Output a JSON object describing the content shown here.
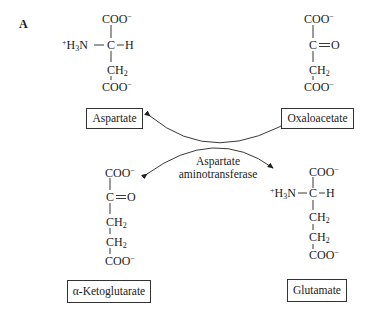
{
  "panel_label": "A",
  "enzyme": {
    "line1": "Aspartate",
    "line2": "aminotransferase"
  },
  "compounds": {
    "aspartate": {
      "name": "Aspartate",
      "top": "COO",
      "charge": "−",
      "amino_left": "H",
      "amino_sub": "3",
      "amino_n": "N",
      "amino_plus": "+",
      "alpha_c": "C",
      "alpha_h": "H",
      "ch2_c": "CH",
      "ch2_sub": "2",
      "bottom": "COO"
    },
    "oxaloacetate": {
      "name": "Oxaloacetate",
      "top": "COO",
      "charge": "−",
      "keto_c": "C",
      "keto_o": "O",
      "ch2_c": "CH",
      "ch2_sub": "2",
      "bottom": "COO"
    },
    "alpha_ketoglutarate": {
      "name": "α-Ketoglutarate",
      "top": "COO",
      "charge": "−",
      "keto_c": "C",
      "keto_o": "O",
      "ch2_c": "CH",
      "ch2_sub": "2",
      "bottom": "COO"
    },
    "glutamate": {
      "name": "Glutamate",
      "top": "COO",
      "charge": "−",
      "amino_left": "H",
      "amino_sub": "3",
      "amino_n": "N",
      "amino_plus": "+",
      "alpha_c": "C",
      "alpha_h": "H",
      "ch2_c": "CH",
      "ch2_sub": "2",
      "bottom": "COO"
    }
  },
  "colors": {
    "ink": "#1a1a1a",
    "background": "#ffffff"
  }
}
